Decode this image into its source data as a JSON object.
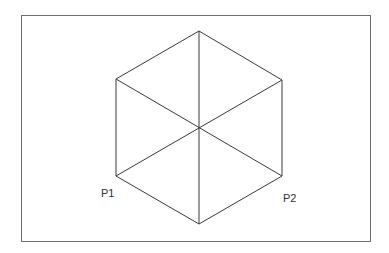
{
  "diagram": {
    "type": "hexagon-with-diagonals",
    "frame": {
      "x": 21,
      "y": 15,
      "width": 349,
      "height": 226,
      "stroke": "#6e6e6e"
    },
    "center": {
      "x": 199,
      "y": 128
    },
    "vertices": {
      "top": {
        "x": 199,
        "y": 31
      },
      "upper_right": {
        "x": 282,
        "y": 80
      },
      "lower_right": {
        "x": 282,
        "y": 176
      },
      "bottom": {
        "x": 199,
        "y": 224
      },
      "lower_left": {
        "x": 116,
        "y": 176
      },
      "upper_left": {
        "x": 116,
        "y": 79
      }
    },
    "line_color": "#3a3a3a",
    "labels": [
      {
        "id": "p1",
        "text": "P1",
        "x": 101,
        "y": 188
      },
      {
        "id": "p2",
        "text": "P2",
        "x": 283,
        "y": 193
      }
    ]
  }
}
